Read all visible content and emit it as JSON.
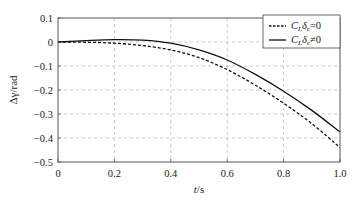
{
  "chart_data": {
    "type": "line",
    "title": "",
    "xlabel": "t/s",
    "xlabel_parts": {
      "var": "t",
      "unit": "/s"
    },
    "ylabel": "Δγ/rad",
    "xlim": [
      0,
      1.0
    ],
    "ylim": [
      -0.5,
      0.1
    ],
    "x_ticks": [
      "0",
      "0.2",
      "0.4",
      "0.6",
      "0.8",
      "1.0"
    ],
    "x_tick_values": [
      0,
      0.2,
      0.4,
      0.6,
      0.8,
      1.0
    ],
    "y_ticks": [
      "0.1",
      "0",
      "−0.1",
      "−0.2",
      "−0.3",
      "−0.4",
      "−0.5"
    ],
    "y_tick_values": [
      0.1,
      0,
      -0.1,
      -0.2,
      -0.3,
      -0.4,
      -0.5
    ],
    "grid": true,
    "legend_position": "upper right",
    "x": [
      0,
      0.1,
      0.2,
      0.3,
      0.4,
      0.5,
      0.6,
      0.7,
      0.8,
      0.9,
      1.0
    ],
    "series": [
      {
        "name": "C_L δ_e = 0",
        "label": "C_Lδ_e=0",
        "style": "dashed",
        "color": "#111111",
        "values": [
          0,
          -0.001,
          -0.005,
          -0.015,
          -0.033,
          -0.065,
          -0.115,
          -0.18,
          -0.255,
          -0.34,
          -0.44
        ]
      },
      {
        "name": "C_L δ_e ≠ 0",
        "label": "C_Lδ_e≠0",
        "style": "solid",
        "color": "#111111",
        "values": [
          0,
          0.006,
          0.01,
          0.008,
          -0.005,
          -0.033,
          -0.075,
          -0.135,
          -0.205,
          -0.285,
          -0.375
        ]
      }
    ]
  },
  "legend": {
    "items": [
      {
        "main": "C",
        "sub1": "L",
        "mid": "δ",
        "sub2": "e",
        "rel": "=0"
      },
      {
        "main": "C",
        "sub1": "L",
        "mid": "δ",
        "sub2": "e",
        "rel": "≠0"
      }
    ]
  }
}
